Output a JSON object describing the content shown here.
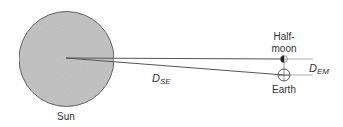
{
  "diagram": {
    "title": "",
    "colors": {
      "sun_fill": "#c4c4c4",
      "sun_stroke": "#666666",
      "line": "#555555",
      "guide_line": "#999999",
      "text": "#333333"
    },
    "bodies": {
      "sun": {
        "label": "Sun",
        "cx": 66.5,
        "cy": 59,
        "r": 47.5
      },
      "half_moon": {
        "label_line1": "Half-",
        "label_line2": "moon",
        "cx": 284,
        "cy": 59
      },
      "earth": {
        "label": "Earth",
        "cx": 284,
        "cy": 75,
        "r": 6
      }
    },
    "distances": {
      "sun_earth": {
        "symbol": "D",
        "subscript": "SE"
      },
      "earth_moon": {
        "symbol": "D",
        "subscript": "EM"
      }
    }
  }
}
